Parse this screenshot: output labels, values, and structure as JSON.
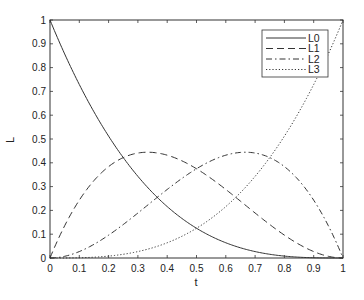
{
  "chart_data": {
    "type": "line",
    "title": "",
    "xlabel": "t",
    "ylabel": "L",
    "xlim": [
      0,
      1
    ],
    "ylim": [
      0,
      1
    ],
    "grid": false,
    "legend_position": "upper right",
    "x_ticks": [
      "0",
      "0.1",
      "0.2",
      "0.3",
      "0.4",
      "0.5",
      "0.6",
      "0.7",
      "0.8",
      "0.9",
      "1"
    ],
    "y_ticks": [
      "0",
      "0.1",
      "0.2",
      "0.3",
      "0.4",
      "0.5",
      "0.6",
      "0.7",
      "0.8",
      "0.9",
      "1"
    ],
    "x": [
      0,
      0.1,
      0.2,
      0.3,
      0.4,
      0.5,
      0.6,
      0.7,
      0.8,
      0.9,
      1
    ],
    "series": [
      {
        "name": "L0",
        "style": "solid",
        "values": [
          1,
          0.729,
          0.512,
          0.343,
          0.216,
          0.125,
          0.064,
          0.027,
          0.008,
          0.001,
          0
        ]
      },
      {
        "name": "L1",
        "style": "dashed",
        "values": [
          0,
          0.243,
          0.384,
          0.441,
          0.432,
          0.375,
          0.288,
          0.189,
          0.096,
          0.027,
          0
        ]
      },
      {
        "name": "L2",
        "style": "dashdot",
        "values": [
          0,
          0.027,
          0.096,
          0.189,
          0.288,
          0.375,
          0.432,
          0.441,
          0.384,
          0.243,
          0
        ]
      },
      {
        "name": "L3",
        "style": "dotted",
        "values": [
          0,
          0.001,
          0.008,
          0.027,
          0.064,
          0.125,
          0.216,
          0.343,
          0.512,
          0.729,
          1
        ]
      }
    ]
  },
  "legend": {
    "items": [
      {
        "label": "L0"
      },
      {
        "label": "L1"
      },
      {
        "label": "L2"
      },
      {
        "label": "L3"
      }
    ]
  },
  "axes": {
    "xlabel": "t",
    "ylabel": "L"
  }
}
